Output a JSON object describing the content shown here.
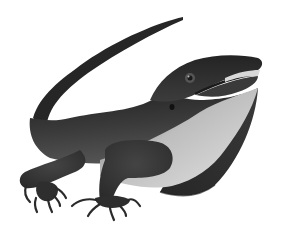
{
  "image": {
    "subject": "lizard with dewlap",
    "description": "Grayscale illustration of a lizard with a long curved tail, open mouth, and large dark throat dewlap, on a white background",
    "style": "grayscale airbrushed illustration",
    "background_color": "#ffffff"
  },
  "colors": {
    "body_dark": "#2a2a2a",
    "body_mid": "#4a4a4a",
    "belly_light": "#c8c8c8",
    "belly_highlight": "#e6e6e6",
    "dewlap": "#2e2e2e",
    "eye": "#555555"
  }
}
